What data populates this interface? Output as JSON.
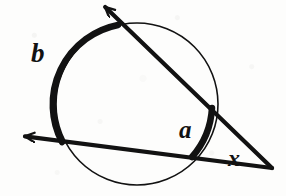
{
  "figure": {
    "kind": "geometry-diagram",
    "topic": "two-secants-from-external-point",
    "background_color": "#fdfdfc",
    "ink_color": "#121212",
    "width": 286,
    "height": 196
  },
  "labels": {
    "far_arc": "b",
    "near_arc": "a",
    "vertex_angle": "x"
  },
  "chart_data": {
    "type": "diagram",
    "title": "",
    "circle": {
      "name": "circle",
      "center_x": 137,
      "center_y": 104,
      "radius": 81,
      "stroke_width_thin": 1.6,
      "stroke_color": "#121212"
    },
    "external_point": {
      "name": "vertex-x",
      "x": 272,
      "y": 168
    },
    "secants": [
      {
        "name": "upper-secant",
        "from_x": 272,
        "from_y": 168,
        "near_intersection_x": 212,
        "near_intersection_y": 108,
        "far_intersection_x": 118,
        "far_intersection_y": 25,
        "arrow_tip_x": 103,
        "arrow_tip_y": 5,
        "stroke_width": 4.2
      },
      {
        "name": "lower-secant",
        "from_x": 272,
        "from_y": 168,
        "near_intersection_x": 192,
        "near_intersection_y": 157,
        "far_intersection_x": 62,
        "far_intersection_y": 142,
        "arrow_tip_x": 22,
        "arrow_tip_y": 136,
        "stroke_width": 4.2
      }
    ],
    "arcs": [
      {
        "name": "far-arc-b",
        "label": "b",
        "start_x": 118,
        "start_y": 25,
        "end_x": 62,
        "end_y": 142,
        "sweep": "counterclockwise-major-left",
        "stroke_width": 6.5,
        "emphasis": "bold"
      },
      {
        "name": "near-arc-a",
        "label": "a",
        "start_x": 212,
        "start_y": 108,
        "end_x": 192,
        "end_y": 157,
        "sweep": "clockwise-minor-right",
        "stroke_width": 6.5,
        "emphasis": "bold"
      }
    ],
    "label_positions": [
      {
        "text": "b",
        "x": 42,
        "y": 55
      },
      {
        "text": "a",
        "x": 190,
        "y": 130
      },
      {
        "text": "x",
        "x": 237,
        "y": 158
      }
    ]
  }
}
